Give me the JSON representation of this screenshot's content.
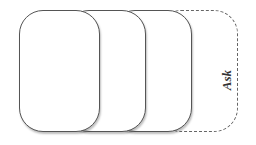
{
  "diagram": {
    "type": "stacked-cards",
    "cards": [
      {
        "id": 1,
        "style": "solid",
        "label": ""
      },
      {
        "id": 2,
        "style": "solid",
        "label": ""
      },
      {
        "id": 3,
        "style": "solid",
        "label": ""
      },
      {
        "id": 4,
        "style": "dashed",
        "label": "Ask"
      }
    ],
    "colors": {
      "stroke": "#555555",
      "fill": "#ffffff",
      "text": "#333333"
    }
  }
}
